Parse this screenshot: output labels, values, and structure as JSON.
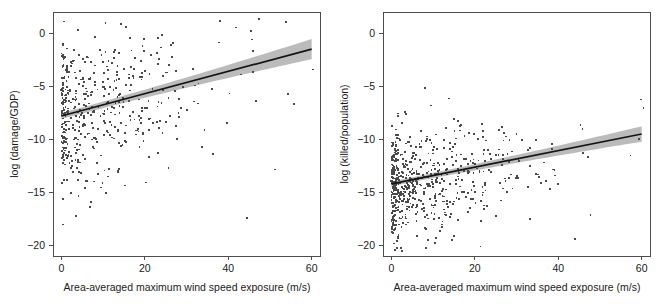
{
  "figure": {
    "background": "#ffffff",
    "point_color": "#4a4a4a",
    "line_color": "#141414",
    "band_color": "#b5b5b5",
    "axis_color": "#4d4d4d"
  },
  "chart_data": [
    {
      "type": "scatter",
      "panel": "left",
      "title": "",
      "xlabel": "Area-averaged maximum wind speed exposure (m/s)",
      "ylabel": "log (damage/GDP)",
      "xlim": [
        -2,
        62
      ],
      "ylim": [
        -21,
        2
      ],
      "xticks": [
        0,
        20,
        40,
        60
      ],
      "xticklabels": [
        "0",
        "20",
        "40",
        "60"
      ],
      "yticks": [
        0,
        -5,
        -10,
        -15,
        -20
      ],
      "yticklabels": [
        "0",
        "−5",
        "−10",
        "−15",
        "−20"
      ],
      "grid": false,
      "legend": "none",
      "n_points": 470,
      "fit": {
        "type": "linear",
        "intercept": -7.8,
        "slope": 0.105,
        "x_start": 0,
        "x_end": 60,
        "y_start": -7.8,
        "y_end": -1.5,
        "ci_halfwidth_start": 0.28,
        "ci_halfwidth_end": 0.95
      },
      "point_cloud": {
        "x_mode": "exponential-like, dense near 0, tail to 60",
        "x_mean": 15.0,
        "y_spread_sd": 3.6,
        "y_mean_at_x0": -7.8,
        "seed": 20240117
      }
    },
    {
      "type": "scatter",
      "panel": "right",
      "title": "",
      "xlabel": "Area-averaged maximum wind speed exposure (m/s)",
      "ylabel": "log (killed/population)",
      "xlim": [
        -2,
        62
      ],
      "ylim": [
        -21,
        2
      ],
      "xticks": [
        0,
        20,
        40,
        60
      ],
      "xticklabels": [
        "0",
        "20",
        "40",
        "60"
      ],
      "yticks": [
        0,
        -5,
        -10,
        -15,
        -20
      ],
      "yticklabels": [
        "0",
        "−5",
        "−10",
        "−15",
        "−20"
      ],
      "grid": false,
      "legend": "none",
      "n_points": 620,
      "fit": {
        "type": "linear",
        "intercept": -14.2,
        "slope": 0.0783,
        "x_start": 0,
        "x_end": 60,
        "y_start": -14.2,
        "y_end": -9.5,
        "ci_halfwidth_start": 0.22,
        "ci_halfwidth_end": 0.72
      },
      "point_cloud": {
        "x_mode": "exponential-like, dense near 0, tail to 60",
        "x_mean": 14.0,
        "y_spread_sd": 2.5,
        "y_mean_at_x0": -14.6,
        "seed": 77341
      }
    }
  ]
}
